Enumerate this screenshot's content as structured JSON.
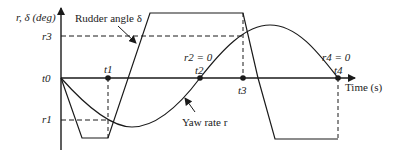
{
  "axes": {
    "y_label": "r, δ (deg)",
    "x_label": "Time (s)",
    "origin_label": "t0"
  },
  "levels": {
    "r3": "r3",
    "r1": "r1"
  },
  "time_marks": [
    {
      "id": "t1",
      "label": "t1"
    },
    {
      "id": "t2",
      "label": "t2",
      "note": "r2 = 0"
    },
    {
      "id": "t3",
      "label": "t3"
    },
    {
      "id": "t4",
      "label": "t4",
      "note": "r4 = 0"
    }
  ],
  "annotations": {
    "rudder": "Rudder angle δ",
    "yaw": "Yaw rate r"
  },
  "colors": {
    "line": "#1a1a1a"
  }
}
